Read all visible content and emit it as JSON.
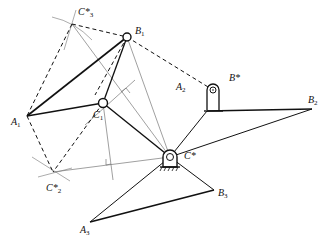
{
  "diagram": {
    "title": "",
    "points": {
      "B1": {
        "x": 127,
        "y": 37
      },
      "C3s": {
        "x": 72,
        "y": 24
      },
      "A1": {
        "x": 27,
        "y": 116
      },
      "C1": {
        "x": 103,
        "y": 103
      },
      "Cs": {
        "x": 170,
        "y": 157
      },
      "A2": {
        "x": 207,
        "y": 108
      },
      "Bs": {
        "x": 213,
        "y": 90
      },
      "B2": {
        "x": 312,
        "y": 109
      },
      "C2s": {
        "x": 53,
        "y": 172
      },
      "A3": {
        "x": 90,
        "y": 222
      },
      "B3": {
        "x": 214,
        "y": 190
      }
    },
    "labels": {
      "C3s": {
        "main": "C*",
        "sub": "3"
      },
      "B1": {
        "main": "B",
        "sub": "1"
      },
      "A1": {
        "main": "A",
        "sub": "1"
      },
      "C1": {
        "main": "C",
        "sub": "1"
      },
      "A2": {
        "main": "A",
        "sub": "2"
      },
      "Bs": {
        "main": "B*",
        "sub": ""
      },
      "B2": {
        "main": "B",
        "sub": "2"
      },
      "Cs": {
        "main": "C*",
        "sub": ""
      },
      "C2s": {
        "main": "C*",
        "sub": "2"
      },
      "B3": {
        "main": "B",
        "sub": "3"
      },
      "A3": {
        "main": "A",
        "sub": "3"
      }
    },
    "colors": {
      "line": "#111111",
      "thin": "#777777"
    }
  }
}
